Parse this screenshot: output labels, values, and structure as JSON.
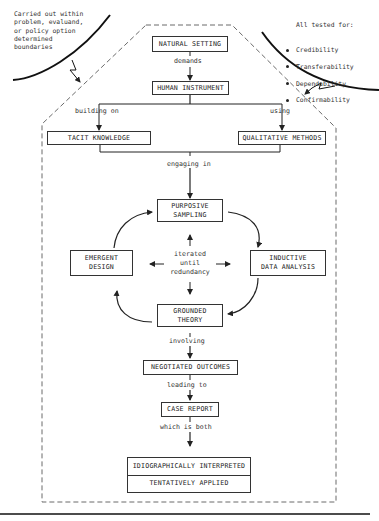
{
  "notes": {
    "left": "Carried out within\nproblem, evaluand,\nor policy option\ndetermined\nboundaries",
    "right_title": "All tested for:",
    "right_items": [
      "Credibility",
      "Transferability",
      "Dependability",
      "Confirmability"
    ]
  },
  "nodes": {
    "natural_setting": "NATURAL SETTING",
    "human_instrument": "HUMAN INSTRUMENT",
    "tacit_knowledge": "TACIT KNOWLEDGE",
    "qualitative_methods": "QUALITATIVE METHODS",
    "purposive_sampling": "PURPOSIVE\nSAMPLING",
    "emergent_design": "EMERGENT\nDESIGN",
    "inductive_data_analysis": "INDUCTIVE\nDATA ANALYSIS",
    "grounded_theory": "GROUNDED\nTHEORY",
    "negotiated_outcomes": "NEGOTIATED OUTCOMES",
    "case_report": "CASE REPORT",
    "idiographically_interpreted": "IDIOGRAPHICALLY INTERPRETED",
    "tentatively_applied": "TENTATIVELY APPLIED"
  },
  "edges": {
    "demands": "demands",
    "building_on": "building on",
    "using": "using",
    "engaging_in": "engaging in",
    "iterated": "iterated\nuntil\nredundancy",
    "involving": "involving",
    "leading_to": "leading to",
    "which_is_both": "which is both"
  }
}
